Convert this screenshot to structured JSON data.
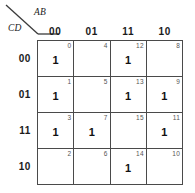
{
  "diagram": {
    "type": "karnaugh-map",
    "column_variable_label": "AB",
    "row_variable_label": "CD",
    "column_headers": [
      "00",
      "01",
      "11",
      "10"
    ],
    "row_headers": [
      "00",
      "01",
      "11",
      "10"
    ],
    "cells": [
      {
        "index": "0",
        "value": "1",
        "column": "00",
        "row": "00"
      },
      {
        "index": "4",
        "value": "",
        "column": "01",
        "row": "00"
      },
      {
        "index": "12",
        "value": "1",
        "column": "11",
        "row": "00"
      },
      {
        "index": "8",
        "value": "",
        "column": "10",
        "row": "00"
      },
      {
        "index": "1",
        "value": "1",
        "column": "00",
        "row": "01"
      },
      {
        "index": "5",
        "value": "",
        "column": "01",
        "row": "01"
      },
      {
        "index": "13",
        "value": "1",
        "column": "11",
        "row": "01"
      },
      {
        "index": "9",
        "value": "1",
        "column": "10",
        "row": "01"
      },
      {
        "index": "3",
        "value": "1",
        "column": "00",
        "row": "11"
      },
      {
        "index": "7",
        "value": "1",
        "column": "01",
        "row": "11"
      },
      {
        "index": "15",
        "value": "",
        "column": "11",
        "row": "11"
      },
      {
        "index": "11",
        "value": "1",
        "column": "10",
        "row": "11"
      },
      {
        "index": "2",
        "value": "",
        "column": "00",
        "row": "10"
      },
      {
        "index": "6",
        "value": "",
        "column": "01",
        "row": "10"
      },
      {
        "index": "14",
        "value": "1",
        "column": "11",
        "row": "10"
      },
      {
        "index": "10",
        "value": "",
        "column": "10",
        "row": "10"
      }
    ],
    "colors": {
      "grid_line": "#4a4a4a",
      "background": "#ffffff",
      "text": "#1a1a1a",
      "index_text": "#555555"
    }
  }
}
